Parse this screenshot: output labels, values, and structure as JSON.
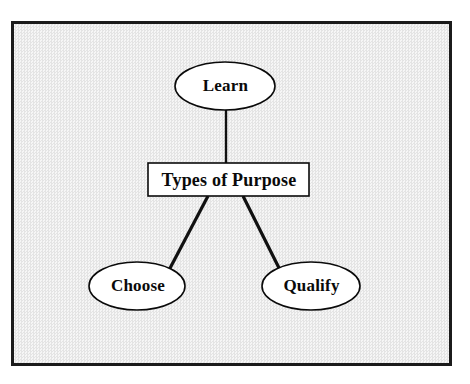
{
  "diagram": {
    "title": "Types of Purpose",
    "type": "hierarchy-tree",
    "background_color": "#eeeeee",
    "frame_color": "#1b1b1b",
    "node_fill": "#ffffff",
    "node_stroke": "#000000",
    "nodes": [
      {
        "id": "learn",
        "label": "Learn",
        "shape": "ellipse",
        "cx": 225,
        "cy": 86,
        "rx": 50,
        "ry": 24
      },
      {
        "id": "root",
        "label": "Types of Purpose",
        "shape": "rectangle",
        "x": 148,
        "y": 163,
        "width": 161,
        "height": 33
      },
      {
        "id": "choose",
        "label": "Choose",
        "shape": "ellipse",
        "cx": 137,
        "cy": 286,
        "rx": 48,
        "ry": 24
      },
      {
        "id": "qualify",
        "label": "Qualify",
        "shape": "ellipse",
        "cx": 311,
        "cy": 286,
        "rx": 49,
        "ry": 24
      }
    ],
    "edges": [
      {
        "id": "edge-root-learn",
        "from": "root",
        "to": "learn",
        "style": "straight"
      },
      {
        "id": "edge-root-choose",
        "from": "root",
        "to": "choose",
        "style": "straight"
      },
      {
        "id": "edge-root-qualify",
        "from": "root",
        "to": "qualify",
        "style": "straight"
      }
    ]
  }
}
